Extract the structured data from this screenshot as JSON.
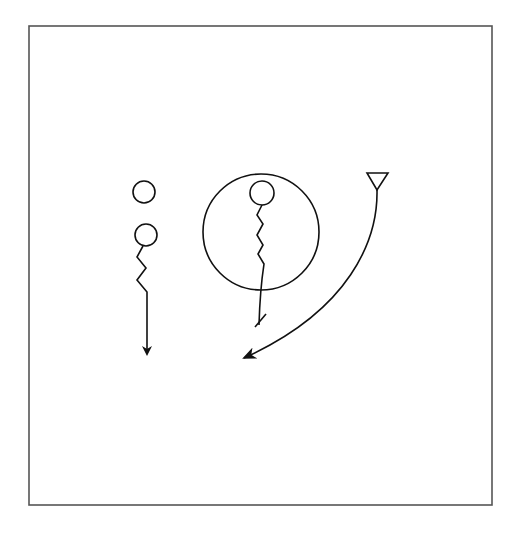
{
  "diagram": {
    "title": "",
    "frame": {
      "x": 29,
      "y": 26,
      "width": 463,
      "height": 479,
      "stroke": "#555555"
    },
    "stroke_color": "#111111",
    "elements": [
      {
        "id": "player-left-1",
        "type": "circle",
        "cx": 144,
        "cy": 192,
        "r": 11
      },
      {
        "id": "player-left-2",
        "type": "circle",
        "cx": 146,
        "cy": 235,
        "r": 11
      },
      {
        "id": "dribble-left",
        "type": "zigzag-arrow",
        "points": "143,247 137,258 146,268 137,280 147,291 147,355",
        "end": "arrow"
      },
      {
        "id": "zone-circle",
        "type": "circle",
        "cx": 261,
        "cy": 232,
        "r": 58
      },
      {
        "id": "player-center",
        "type": "circle",
        "cx": 262,
        "cy": 193,
        "r": 12
      },
      {
        "id": "dribble-center",
        "type": "zigzag-stop",
        "end": "stop-bar"
      },
      {
        "id": "cone",
        "type": "triangle",
        "points": "367,173 388,173 377,190"
      },
      {
        "id": "run-path",
        "type": "curve-arrow",
        "end": "arrow"
      }
    ]
  }
}
